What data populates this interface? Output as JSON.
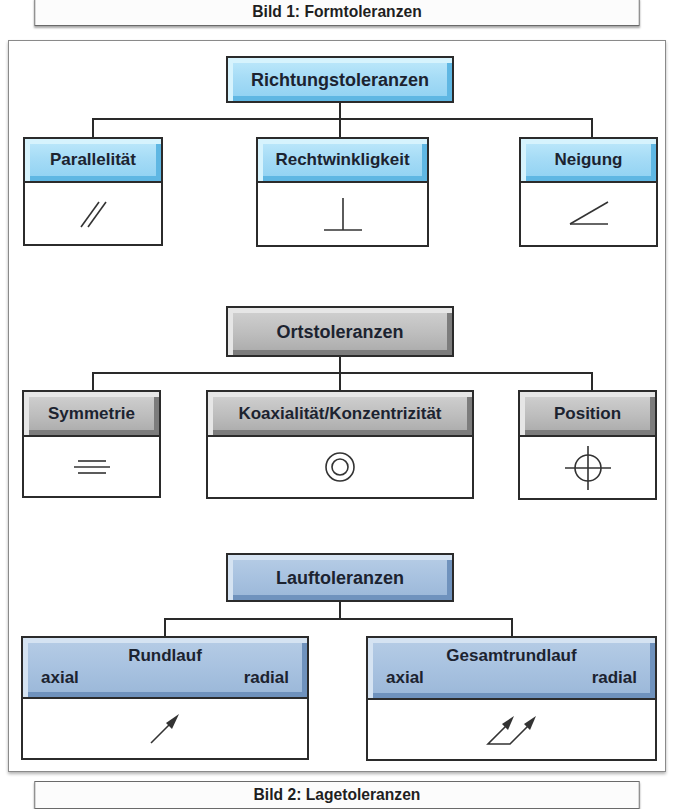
{
  "captions": {
    "top": "Bild 1: Formtoleranzen",
    "bottom": "Bild 2: Lagetoleranzen"
  },
  "colors": {
    "richtung_header": "#a6dcf6",
    "ort_header": "#bdbdbd",
    "lauf_header": "#a8c2e0",
    "line": "#2a2a2a"
  },
  "groups": {
    "richtung": {
      "title": "Richtungstoleranzen",
      "children": [
        {
          "label": "Parallelität",
          "symbol": "parallelism-icon"
        },
        {
          "label": "Rechtwinkligkeit",
          "symbol": "perpendicularity-icon"
        },
        {
          "label": "Neigung",
          "symbol": "angularity-icon"
        }
      ]
    },
    "ort": {
      "title": "Ortstoleranzen",
      "children": [
        {
          "label": "Symmetrie",
          "symbol": "symmetry-icon"
        },
        {
          "label": "Koaxialität/Konzentrizität",
          "symbol": "concentricity-icon"
        },
        {
          "label": "Position",
          "symbol": "position-icon"
        }
      ]
    },
    "lauf": {
      "title": "Lauftoleranzen",
      "children": [
        {
          "label": "Rundlauf",
          "left": "axial",
          "right": "radial",
          "symbol": "circular-runout-icon"
        },
        {
          "label": "Gesamtrundlauf",
          "left": "axial",
          "right": "radial",
          "symbol": "total-runout-icon"
        }
      ]
    }
  }
}
